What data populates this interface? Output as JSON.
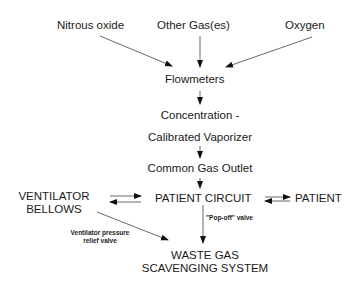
{
  "diagram": {
    "type": "flowchart",
    "title": "",
    "nodes": {
      "nitrous_oxide": "Nitrous oxide",
      "other_gases": "Other Gas(es)",
      "oxygen": "Oxygen",
      "flowmeters": "Flowmeters",
      "vaporizer_line1": "Concentration -",
      "vaporizer_line2": "Calibrated Vaporizer",
      "common_gas_outlet": "Common Gas Outlet",
      "patient_circuit": "PATIENT CIRCUIT",
      "patient": "PATIENT",
      "ventilator_line1": "VENTILATOR",
      "ventilator_line2": "BELLOWS",
      "waste_line1": "WASTE GAS",
      "waste_line2": "SCAVENGING SYSTEM"
    },
    "edge_labels": {
      "vent_relief_line1": "Ventilator pressure",
      "vent_relief_line2": "relief valve",
      "pop_off": "\"Pop-off\" valve"
    },
    "edges": [
      {
        "from": "Nitrous oxide",
        "to": "Flowmeters"
      },
      {
        "from": "Other Gas(es)",
        "to": "Flowmeters"
      },
      {
        "from": "Oxygen",
        "to": "Flowmeters"
      },
      {
        "from": "Flowmeters",
        "to": "Concentration - Calibrated Vaporizer"
      },
      {
        "from": "Concentration - Calibrated Vaporizer",
        "to": "Common Gas Outlet"
      },
      {
        "from": "Common Gas Outlet",
        "to": "PATIENT CIRCUIT"
      },
      {
        "from": "VENTILATOR BELLOWS",
        "to": "PATIENT CIRCUIT",
        "bidirectional": true
      },
      {
        "from": "PATIENT CIRCUIT",
        "to": "PATIENT",
        "bidirectional": true
      },
      {
        "from": "PATIENT CIRCUIT",
        "to": "WASTE GAS SCAVENGING SYSTEM",
        "label": "\"Pop-off\" valve"
      },
      {
        "from": "VENTILATOR BELLOWS",
        "to": "WASTE GAS SCAVENGING SYSTEM",
        "label": "Ventilator pressure relief valve"
      }
    ]
  }
}
